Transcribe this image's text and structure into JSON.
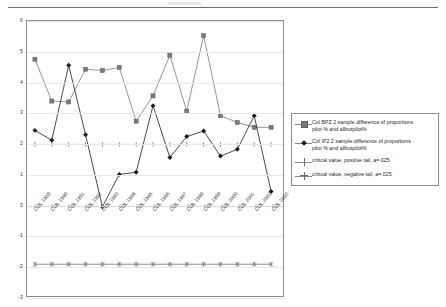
{
  "chart_data": {
    "type": "line",
    "title": "",
    "xlabel": "",
    "ylabel": "",
    "ylim": [
      -3,
      6
    ],
    "yticks": [
      6,
      5,
      4,
      3,
      2,
      1,
      0,
      -1,
      -2,
      -3
    ],
    "grid": true,
    "legend_position": "right",
    "categories": [
      "COL 1989",
      "COL 1990",
      "COL 1991",
      "COL 1992",
      "COL 1993",
      "COL 1994",
      "COL 1995",
      "COL 1996",
      "COL 1997",
      "COL 1998",
      "COL 1999",
      "COL 2000",
      "COL 2001",
      "COL 2002",
      "COL 2003"
    ],
    "series": [
      {
        "name": "Col BPZ 2 sample difference of proportions pilot % and allbutpilot%",
        "marker": "square",
        "color": "#7a7a7a",
        "values": [
          4.75,
          3.38,
          3.35,
          4.42,
          4.38,
          4.48,
          2.72,
          3.55,
          4.88,
          3.05,
          5.52,
          2.9,
          2.68,
          2.52,
          2.52
        ]
      },
      {
        "name": "Col IP2 2 sample difference of proportions pilot % and allbutpilot%",
        "marker": "diamond",
        "color": "#1d1d1d",
        "values": [
          2.42,
          2.1,
          4.55,
          2.28,
          -0.08,
          0.98,
          1.05,
          3.23,
          1.53,
          2.22,
          2.4,
          1.58,
          1.8,
          2.9,
          0.42
        ]
      },
      {
        "name": "critical value, positive tail, a=.025",
        "marker": "plus",
        "color": "#6e6e6e",
        "values": [
          1.96,
          1.96,
          1.96,
          1.96,
          1.96,
          1.96,
          1.96,
          1.96,
          1.96,
          1.96,
          1.96,
          1.96,
          1.96,
          1.96,
          1.96
        ]
      },
      {
        "name": "critical value, negative tail, a=.025",
        "marker": "star",
        "color": "#6e6e6e",
        "values": [
          -1.96,
          -1.96,
          -1.96,
          -1.96,
          -1.96,
          -1.96,
          -1.96,
          -1.96,
          -1.96,
          -1.96,
          -1.96,
          -1.96,
          -1.96,
          -1.96,
          -1.96
        ]
      }
    ]
  },
  "legend": {
    "entries": [
      {
        "line1": "Col BPZ 2 sample difference of proportions",
        "line2": "pilot % and allbutpilot%"
      },
      {
        "line1": "Col IP2 2 sample difference of proportions",
        "line2": "pilot % and allbutpilot%"
      },
      {
        "line1": "critical value, positive tail, a=.025",
        "line2": ""
      },
      {
        "line1": "critical value, negative tail, a=.025",
        "line2": ""
      }
    ]
  }
}
